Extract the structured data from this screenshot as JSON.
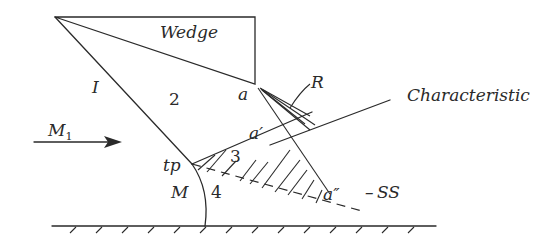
{
  "diagram": {
    "labels": {
      "wedge": "Wedge",
      "region_1": "I",
      "region_2": "2",
      "region_3": "3",
      "region_4": "4",
      "corner_a": "a",
      "point_a_prime": "a′",
      "point_a_double_prime": "a″",
      "rarefaction": "R",
      "characteristic": "Characteristic",
      "freestream_mach": "M",
      "freestream_mach_sub": "1",
      "triple_point": "tp",
      "mach_stem": "M",
      "slipstream": "SS"
    },
    "colors": {
      "stroke": "#2a2a2a",
      "background": "#ffffff"
    }
  }
}
